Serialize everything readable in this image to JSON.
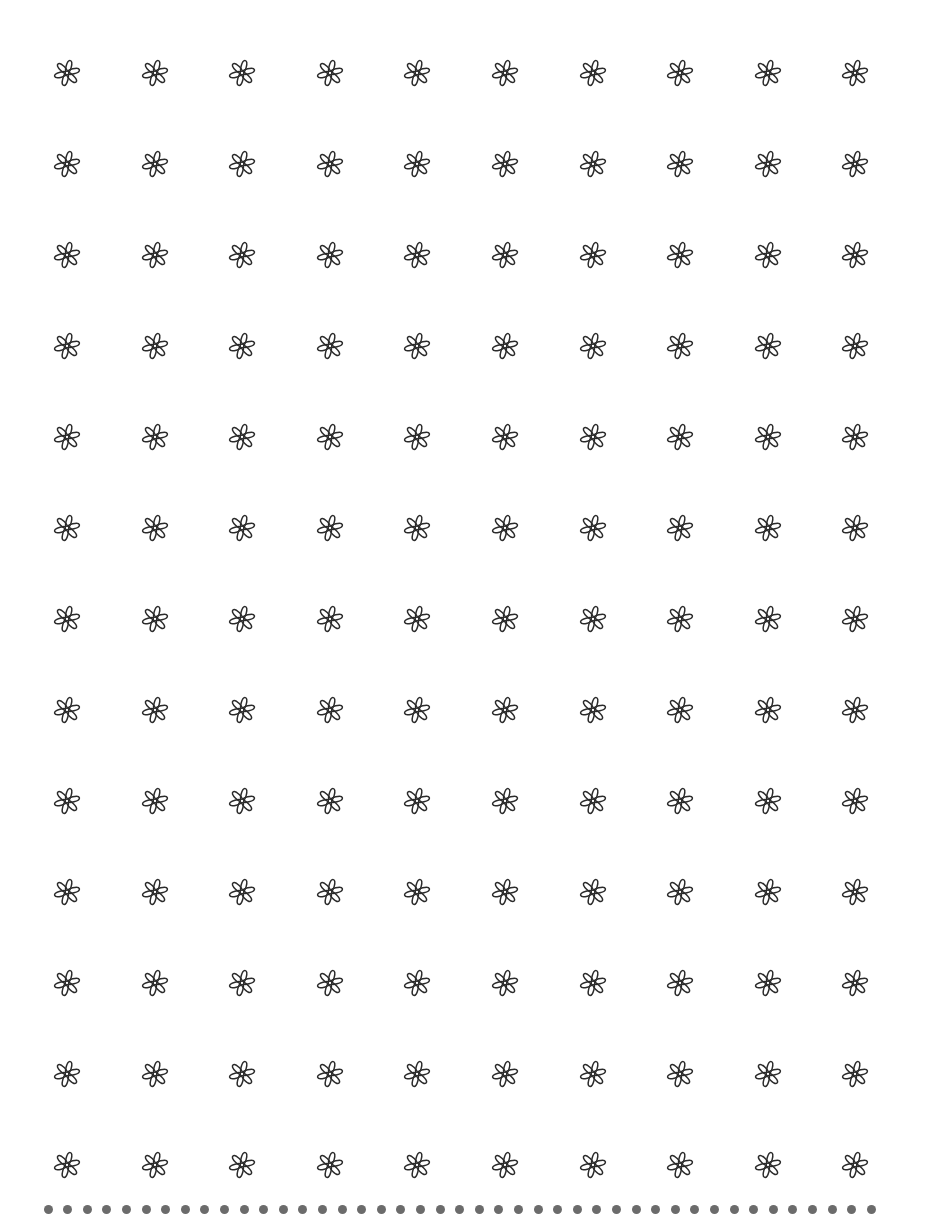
{
  "page": {
    "background": "#ffffff",
    "width": 930,
    "height": 1219
  },
  "pattern": {
    "icon": "six-petal-flower-icon",
    "stroke_color": "#2b2b2b",
    "columns": 10,
    "rows": 13,
    "first_center_x": 67,
    "first_center_y": 73,
    "col_spacing": 87.6,
    "row_spacing": 91,
    "size": 30
  },
  "border": {
    "type": "dotted-line",
    "color": "#6b6b6b",
    "count": 43,
    "start_x": 48,
    "spacing": 19.6,
    "center_y": 1209,
    "diameter": 9
  }
}
